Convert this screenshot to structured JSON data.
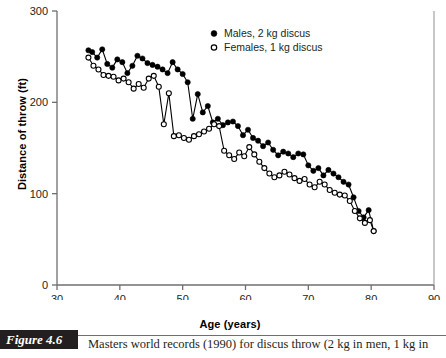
{
  "figure": {
    "number_label": "Figure 4.6",
    "caption": "Masters world records (1990) for discus throw (2 kg in men, 1 kg in"
  },
  "chart_data": {
    "type": "line",
    "title": "",
    "xlabel": "Age (years)",
    "ylabel": "Distance of throw (ft)",
    "xlim": [
      30,
      90
    ],
    "ylim": [
      0,
      300
    ],
    "xticks": [
      30,
      40,
      50,
      60,
      70,
      80,
      90
    ],
    "yticks": [
      0,
      100,
      200,
      300
    ],
    "grid": false,
    "legend_position": "top-center",
    "marker_style": {
      "Males, 2 kg discus": "filled-circle",
      "Females, 1 kg discus": "open-circle"
    },
    "series": [
      {
        "name": "Males, 2 kg discus",
        "marker": "filled-circle",
        "color": "#000000",
        "x": [
          35,
          35.6,
          36.4,
          37.2,
          38,
          38.8,
          39.6,
          40.4,
          41.2,
          42,
          42.8,
          43.6,
          44.4,
          45.2,
          46,
          46.8,
          47.6,
          48.4,
          49.2,
          50,
          50.8,
          51.6,
          52.4,
          53.2,
          54,
          54.8,
          55.6,
          56.4,
          57.2,
          58,
          58.8,
          59.6,
          60.4,
          61.2,
          62,
          62.8,
          63.6,
          64.4,
          65.2,
          66,
          66.8,
          67.6,
          68.4,
          69.2,
          70,
          70.8,
          71.6,
          72.4,
          73.2,
          74,
          74.8,
          75.6,
          76.4,
          77.2,
          78,
          78.8,
          79.6,
          80.4
        ],
        "y": [
          257,
          255,
          249,
          258,
          242,
          238,
          247,
          244,
          232,
          240,
          251,
          248,
          243,
          241,
          239,
          236,
          232,
          244,
          236,
          231,
          222,
          182,
          209,
          189,
          196,
          178,
          182,
          175,
          178,
          179,
          174,
          164,
          170,
          161,
          158,
          152,
          156,
          148,
          142,
          146,
          144,
          140,
          144,
          143,
          131,
          125,
          128,
          120,
          126,
          122,
          118,
          113,
          110,
          96,
          81,
          74,
          82,
          59
        ]
      },
      {
        "name": "Females, 1 kg discus",
        "marker": "open-circle",
        "color": "#000000",
        "x": [
          35,
          35.8,
          36.6,
          37.4,
          38.2,
          39,
          39.8,
          40.6,
          41.4,
          42.2,
          43,
          43.8,
          44.6,
          45.4,
          46.2,
          47,
          47.8,
          48.6,
          49.4,
          50.2,
          51,
          51.8,
          52.6,
          53.4,
          54.2,
          55,
          55.8,
          56.6,
          57.4,
          58.2,
          59,
          59.8,
          60.6,
          61.4,
          62.2,
          63,
          63.8,
          64.6,
          65.4,
          66.2,
          67,
          67.8,
          68.6,
          69.4,
          70.2,
          71,
          71.8,
          72.6,
          73.4,
          74.2,
          75,
          75.8,
          76.6,
          77.4,
          78.2,
          79,
          79.8,
          80.4
        ],
        "y": [
          249,
          240,
          236,
          230,
          229,
          228,
          224,
          226,
          222,
          215,
          220,
          216,
          226,
          229,
          217,
          176,
          210,
          163,
          164,
          161,
          159,
          163,
          165,
          168,
          171,
          176,
          174,
          147,
          142,
          138,
          145,
          141,
          151,
          143,
          135,
          128,
          122,
          118,
          120,
          124,
          121,
          117,
          114,
          116,
          110,
          107,
          113,
          110,
          104,
          101,
          99,
          98,
          92,
          81,
          73,
          68,
          71,
          59
        ]
      }
    ]
  }
}
